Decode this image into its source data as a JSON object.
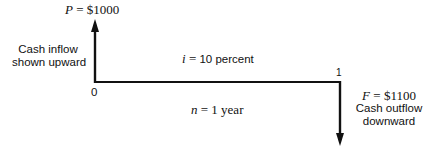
{
  "diagram": {
    "type": "cash-flow-diagram",
    "present_value": {
      "symbol": "P",
      "eq": " = ",
      "amount": "$1000"
    },
    "future_value": {
      "symbol": "F",
      "eq": " = ",
      "amount": "$1100"
    },
    "interest": {
      "symbol": "i",
      "eq": " = ",
      "value": "10 percent"
    },
    "period": {
      "symbol": "n",
      "eq": " = ",
      "value": "1 year"
    },
    "time_labels": {
      "start": "0",
      "end": "1"
    },
    "inflow_note": {
      "line1": "Cash inflow",
      "line2": "shown upward"
    },
    "outflow_note": {
      "line1": "Cash outflow",
      "line2": "downward"
    },
    "colors": {
      "line": "#111111",
      "background": "#ffffff"
    }
  }
}
